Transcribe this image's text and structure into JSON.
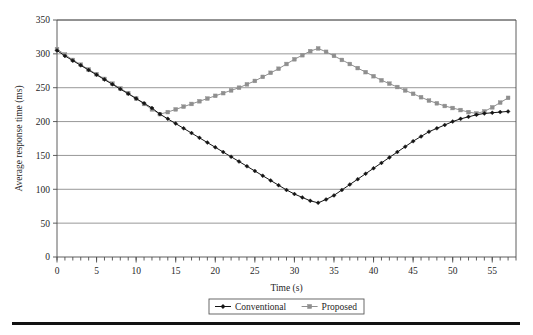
{
  "chart_data": {
    "type": "line",
    "title": "",
    "xlabel": "Time (s)",
    "ylabel": "Average response time (ms)",
    "xlim": [
      0,
      58
    ],
    "ylim": [
      0,
      350
    ],
    "ytick_step": 50,
    "xtick_label_step": 5,
    "xtick_minor_step": 1,
    "grid": "horizontal",
    "legend_position": "bottom-center",
    "yticks": [
      0,
      50,
      100,
      150,
      200,
      250,
      300,
      350
    ],
    "xticks": [
      0,
      5,
      10,
      15,
      20,
      25,
      30,
      35,
      40,
      45,
      50,
      55
    ],
    "series": [
      {
        "name": "Conventional",
        "color": "#141414",
        "marker": "diamond",
        "x": [
          0,
          1,
          2,
          3,
          4,
          5,
          6,
          7,
          8,
          9,
          10,
          11,
          12,
          13,
          14,
          15,
          16,
          17,
          18,
          19,
          20,
          21,
          22,
          23,
          24,
          25,
          26,
          27,
          28,
          29,
          30,
          31,
          32,
          33,
          34,
          35,
          36,
          37,
          38,
          39,
          40,
          41,
          42,
          43,
          44,
          45,
          46,
          47,
          48,
          49,
          50,
          51,
          52,
          53,
          54,
          55,
          56,
          57
        ],
        "values": [
          305,
          297,
          290,
          283,
          276,
          269,
          262,
          255,
          248,
          241,
          234,
          227,
          220,
          211,
          204,
          197,
          190,
          183,
          176,
          169,
          162,
          155,
          148,
          141,
          134,
          127,
          120,
          113,
          106,
          99,
          93,
          88,
          83,
          80,
          85,
          91,
          99,
          107,
          115,
          123,
          131,
          139,
          147,
          155,
          163,
          171,
          178,
          185,
          190,
          195,
          200,
          204,
          207,
          210,
          212,
          213,
          214,
          215
        ]
      },
      {
        "name": "Proposed",
        "color": "#8f8f8f",
        "marker": "square",
        "x": [
          0,
          1,
          2,
          3,
          4,
          5,
          6,
          7,
          8,
          9,
          10,
          11,
          12,
          13,
          14,
          15,
          16,
          17,
          18,
          19,
          20,
          21,
          22,
          23,
          24,
          25,
          26,
          27,
          28,
          29,
          30,
          31,
          32,
          33,
          34,
          35,
          36,
          37,
          38,
          39,
          40,
          41,
          42,
          43,
          44,
          45,
          46,
          47,
          48,
          49,
          50,
          51,
          52,
          53,
          54,
          55,
          56,
          57
        ],
        "values": [
          307,
          299,
          291,
          284,
          277,
          270,
          263,
          256,
          249,
          242,
          234,
          226,
          218,
          211,
          214,
          218,
          222,
          226,
          230,
          234,
          238,
          242,
          246,
          250,
          255,
          260,
          266,
          272,
          278,
          285,
          292,
          298,
          304,
          308,
          303,
          297,
          291,
          285,
          279,
          273,
          267,
          261,
          256,
          251,
          246,
          241,
          236,
          231,
          227,
          223,
          220,
          217,
          214,
          212,
          215,
          221,
          228,
          235
        ]
      }
    ]
  },
  "legend": {
    "items": [
      {
        "label": "Conventional",
        "marker": "diamond",
        "color": "#141414"
      },
      {
        "label": "Proposed",
        "marker": "square",
        "color": "#8f8f8f"
      }
    ]
  }
}
